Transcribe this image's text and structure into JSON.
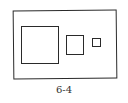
{
  "figure": {
    "caption": "6-4",
    "shapes": [
      {
        "name": "outer-rectangle"
      },
      {
        "name": "large-square"
      },
      {
        "name": "medium-square"
      },
      {
        "name": "small-square"
      }
    ]
  }
}
